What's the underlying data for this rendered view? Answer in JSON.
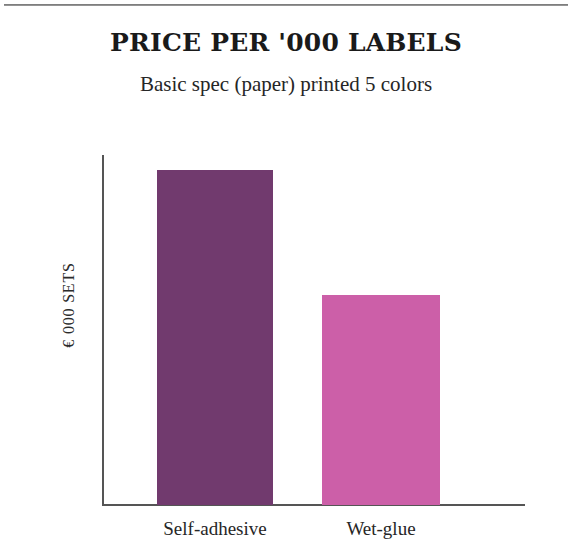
{
  "figure": {
    "title": "PRICE PER '000 LABELS",
    "subtitle": "Basic spec (paper) printed 5 colors",
    "background_color": "#ffffff",
    "axis_color": "#555555"
  },
  "chart_data": {
    "type": "bar",
    "title": "PRICE PER '000 LABELS",
    "subtitle": "Basic spec (paper) printed 5 colors",
    "xlabel": "",
    "ylabel": "€ 000 SETS",
    "categories": [
      "Self-adhesive",
      "Wet-glue"
    ],
    "values": [
      100,
      62.7
    ],
    "ylim": [
      0,
      117
    ],
    "grid": false,
    "legend": false,
    "tick_labels_y": [],
    "colors": [
      "#713A6E",
      "#CC5FA8"
    ],
    "series": [
      {
        "name": "Price per '000 labels",
        "values": [
          100,
          62.7
        ]
      }
    ],
    "bars": [
      {
        "label": "Self-adhesive",
        "value": 100,
        "height_fraction": 0.957,
        "color": "#713A6E"
      },
      {
        "label": "Wet-glue",
        "value": 62.7,
        "height_fraction": 0.6,
        "color": "#CC5FA8"
      }
    ]
  }
}
